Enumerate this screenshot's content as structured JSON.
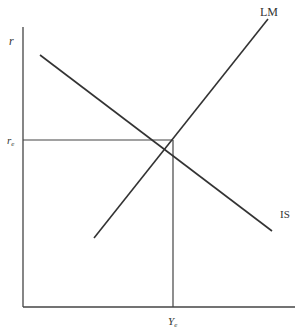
{
  "diagram": {
    "type": "IS-LM model",
    "y_axis_label": "r",
    "x_axis_label_equilibrium": "Ye",
    "y_equilibrium_label": "re",
    "curves": [
      {
        "name": "LM",
        "label": "LM",
        "slope": "upward"
      },
      {
        "name": "IS",
        "label": "IS",
        "slope": "downward"
      }
    ],
    "colors": {
      "line": "#333333",
      "background": "#ffffff"
    }
  },
  "labels": {
    "r": "r",
    "r_sub": "e",
    "r_main": "r",
    "Y_main": "Y",
    "Y_sub": "e",
    "LM": "LM",
    "IS": "IS"
  }
}
